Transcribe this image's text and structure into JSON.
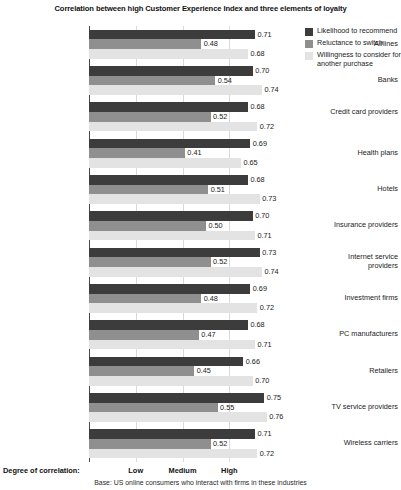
{
  "chart_data": {
    "type": "bar",
    "orientation": "horizontal",
    "title": "Correlation between high Customer Experience Index and three elements of loyalty",
    "xlabel": "Degree of correlation:",
    "ylabel": "",
    "xlim": [
      0,
      0.8
    ],
    "grid": true,
    "legend_position": "right",
    "footnote": "Base: US online consumers who interact with firms in these industries",
    "tick_labels": [
      {
        "label": "Low",
        "value": 0.2
      },
      {
        "label": "Medium",
        "value": 0.4
      },
      {
        "label": "High",
        "value": 0.6
      }
    ],
    "categories": [
      "Airlines",
      "Banks",
      "Credit card providers",
      "Health plans",
      "Hotels",
      "Insurance providers",
      "Internet service providers",
      "Investment firms",
      "PC manufacturers",
      "Retailers",
      "TV service providers",
      "Wireless carriers"
    ],
    "series": [
      {
        "name": "Likelihood to recommend",
        "color": "#3c3c3c",
        "values": [
          0.71,
          0.7,
          0.68,
          0.69,
          0.68,
          0.7,
          0.73,
          0.69,
          0.68,
          0.66,
          0.75,
          0.71
        ]
      },
      {
        "name": "Reluctance to switch",
        "color": "#8f8f8f",
        "values": [
          0.48,
          0.54,
          0.52,
          0.41,
          0.51,
          0.5,
          0.52,
          0.48,
          0.47,
          0.45,
          0.55,
          0.52
        ]
      },
      {
        "name": "Willingness to consider for another purchase",
        "color": "#e3e3e3",
        "values": [
          0.68,
          0.74,
          0.72,
          0.65,
          0.73,
          0.71,
          0.74,
          0.72,
          0.71,
          0.7,
          0.76,
          0.72
        ]
      }
    ]
  },
  "legend": {
    "items": [
      {
        "label": "Likelihood to recommend",
        "color": "#3c3c3c"
      },
      {
        "label": "Reluctance to switch",
        "color": "#8f8f8f"
      },
      {
        "label": "Willingness to consider for another purchase",
        "color": "#e3e3e3"
      }
    ]
  }
}
